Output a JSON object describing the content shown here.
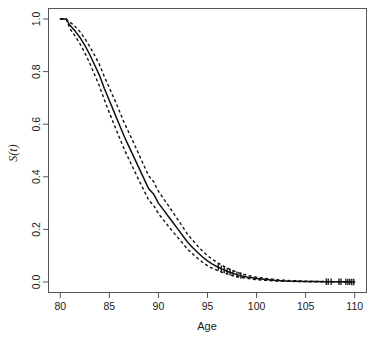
{
  "chart_data": {
    "type": "line",
    "title": "",
    "subtitle": "",
    "xlabel": "Age",
    "ylabel": "S(t)",
    "xlim": [
      80,
      110
    ],
    "ylim": [
      0.0,
      1.0
    ],
    "grid": false,
    "legend": null,
    "legend_position": "none",
    "xticks": [
      80,
      85,
      90,
      95,
      100,
      105,
      110
    ],
    "xtick_labels": [
      "80",
      "85",
      "90",
      "95",
      "100",
      "105",
      "110"
    ],
    "yticks": [
      0.0,
      0.2,
      0.4,
      0.6,
      0.8,
      1.0
    ],
    "ytick_labels": [
      "0.0",
      "0.2",
      "0.4",
      "0.6",
      "0.8",
      "1.0"
    ],
    "annotations": [],
    "x": [
      80.0,
      80.6,
      81.0,
      81.5,
      82.0,
      82.5,
      83.0,
      83.5,
      84.0,
      84.5,
      85.0,
      85.5,
      86.0,
      86.5,
      87.0,
      87.5,
      88.0,
      88.5,
      89.0,
      89.5,
      90.0,
      90.5,
      91.0,
      91.5,
      92.0,
      92.5,
      93.0,
      93.5,
      94.0,
      94.5,
      95.0,
      95.5,
      96.0,
      96.5,
      97.0,
      97.5,
      98.0,
      98.5,
      99.0,
      99.5,
      100.0,
      101.0,
      102.0,
      103.0,
      104.0,
      105.0,
      106.0,
      107.0,
      108.0,
      109.0,
      110.0
    ],
    "series": [
      {
        "name": "Survival estimate S(t)",
        "style": "solid",
        "values": [
          1.0,
          1.0,
          0.975,
          0.955,
          0.93,
          0.9,
          0.865,
          0.825,
          0.785,
          0.735,
          0.69,
          0.645,
          0.6,
          0.555,
          0.515,
          0.475,
          0.435,
          0.395,
          0.355,
          0.335,
          0.3,
          0.275,
          0.25,
          0.225,
          0.2,
          0.175,
          0.15,
          0.13,
          0.112,
          0.095,
          0.08,
          0.068,
          0.058,
          0.049,
          0.041,
          0.034,
          0.028,
          0.023,
          0.019,
          0.016,
          0.013,
          0.009,
          0.006,
          0.004,
          0.003,
          0.002,
          0.0015,
          0.001,
          0.0008,
          0.0005,
          0.0
        ]
      },
      {
        "name": "Upper 95% confidence limit",
        "style": "dashed",
        "values": [
          1.0,
          1.0,
          0.988,
          0.972,
          0.952,
          0.926,
          0.896,
          0.862,
          0.826,
          0.78,
          0.738,
          0.696,
          0.652,
          0.607,
          0.567,
          0.527,
          0.486,
          0.445,
          0.404,
          0.382,
          0.345,
          0.318,
          0.291,
          0.264,
          0.236,
          0.208,
          0.18,
          0.158,
          0.137,
          0.117,
          0.1,
          0.086,
          0.074,
          0.063,
          0.053,
          0.045,
          0.037,
          0.031,
          0.026,
          0.022,
          0.018,
          0.013,
          0.009,
          0.006,
          0.0045,
          0.003,
          0.0022,
          0.0016,
          0.0012,
          0.0008,
          0.0
        ]
      },
      {
        "name": "Lower 95% confidence limit",
        "style": "dashed",
        "values": [
          1.0,
          1.0,
          0.962,
          0.936,
          0.906,
          0.872,
          0.832,
          0.788,
          0.744,
          0.692,
          0.644,
          0.597,
          0.551,
          0.506,
          0.466,
          0.427,
          0.388,
          0.35,
          0.312,
          0.292,
          0.26,
          0.236,
          0.213,
          0.19,
          0.168,
          0.146,
          0.124,
          0.106,
          0.09,
          0.075,
          0.062,
          0.052,
          0.044,
          0.037,
          0.031,
          0.025,
          0.021,
          0.017,
          0.014,
          0.011,
          0.009,
          0.006,
          0.004,
          0.0027,
          0.0018,
          0.0012,
          0.0009,
          0.0006,
          0.0004,
          0.0002,
          0.0
        ]
      }
    ],
    "censored_marks": [
      96.1,
      96.4,
      96.7,
      97.0,
      97.3,
      97.6,
      98.0,
      98.4,
      107.1,
      107.3,
      107.6,
      108.4,
      108.6,
      109.1,
      109.3,
      109.5,
      109.7,
      109.9
    ]
  }
}
